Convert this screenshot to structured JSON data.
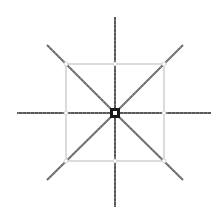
{
  "diagram": {
    "type": "radial-spoke-schematic",
    "canvas": {
      "width": 222,
      "height": 214,
      "background": "#ffffff"
    },
    "center": {
      "x": 115,
      "y": 113
    },
    "square": {
      "x": 66,
      "y": 64,
      "width": 98,
      "height": 97,
      "stroke": "#b8b8b8"
    },
    "center_box": {
      "size": 10,
      "fill": "#1a1a1a",
      "inner_fill": "#ffffff",
      "inner_size": 4
    },
    "spokes": [
      {
        "name": "north",
        "x2": 115,
        "y2": 17,
        "stroke": "#5a5a5a"
      },
      {
        "name": "south",
        "x2": 115,
        "y2": 207,
        "stroke": "#5a5a5a"
      },
      {
        "name": "west",
        "x2": 17,
        "y2": 113,
        "stroke": "#5a5a5a"
      },
      {
        "name": "east",
        "x2": 211,
        "y2": 113,
        "stroke": "#5a5a5a"
      },
      {
        "name": "north-west",
        "x2": 47,
        "y2": 45,
        "stroke": "#6a6a6a"
      },
      {
        "name": "north-east",
        "x2": 183,
        "y2": 45,
        "stroke": "#6a6a6a"
      },
      {
        "name": "south-west",
        "x2": 47,
        "y2": 180,
        "stroke": "#6a6a6a"
      },
      {
        "name": "south-east",
        "x2": 183,
        "y2": 180,
        "stroke": "#6a6a6a"
      }
    ],
    "nodes": [
      {
        "name": "top-left",
        "x": 66,
        "y": 64
      },
      {
        "name": "top-mid",
        "x": 115,
        "y": 64
      },
      {
        "name": "top-right",
        "x": 164,
        "y": 64
      },
      {
        "name": "mid-left",
        "x": 66,
        "y": 113
      },
      {
        "name": "mid-right",
        "x": 164,
        "y": 113
      },
      {
        "name": "bottom-left",
        "x": 66,
        "y": 161
      },
      {
        "name": "bottom-mid",
        "x": 115,
        "y": 161
      },
      {
        "name": "bottom-right",
        "x": 164,
        "y": 161
      }
    ],
    "node_style": {
      "radius": 2,
      "fill": "#ffffff",
      "stroke": "#cfcfcf"
    }
  }
}
